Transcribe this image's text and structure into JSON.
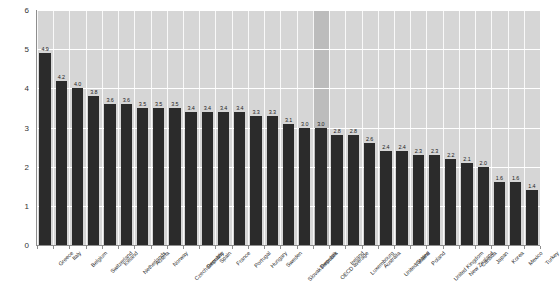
{
  "chart_data": {
    "type": "bar",
    "title": "",
    "subtitle": "",
    "xlabel": "",
    "ylabel": "",
    "ylim": [
      0,
      6
    ],
    "ytick_labels": [
      "0",
      "1",
      "2",
      "3",
      "4",
      "5",
      "6"
    ],
    "ytick_values": [
      0,
      1,
      2,
      3,
      4,
      5,
      6
    ],
    "grid": "horizontal-and-vertical",
    "legend": "none",
    "bar_color": "#2b2b2b",
    "plot_background": "#d6d6d6",
    "highlight_color": "#bcbcbc",
    "highlight_category": "OECD average",
    "categories": [
      "Greece",
      "Italy",
      "Belgium",
      "Switzerland",
      "Iceland",
      "Netherlands",
      "Austria",
      "Norway",
      "Czech Republic",
      "Germany",
      "Spain",
      "France",
      "Portugal",
      "Hungary",
      "Sweden",
      "Slovak Republic",
      "Denmark",
      "OECD average",
      "Ireland",
      "Luxembourg",
      "Australia",
      "United States",
      "Finland",
      "Poland",
      "United Kingdom",
      "New Zealand",
      "Canada",
      "Japan",
      "Korea",
      "Mexico",
      "Turkey"
    ],
    "values": [
      4.9,
      4.2,
      4.0,
      3.8,
      3.6,
      3.6,
      3.5,
      3.5,
      3.5,
      3.4,
      3.4,
      3.4,
      3.4,
      3.3,
      3.3,
      3.1,
      3.0,
      3.0,
      2.8,
      2.8,
      2.6,
      2.4,
      2.4,
      2.3,
      2.3,
      2.2,
      2.1,
      2.0,
      1.6,
      1.6,
      1.4
    ],
    "data_labels": [
      "4.9",
      "4.2",
      "4.0",
      "3.8",
      "3.6",
      "3.6",
      "3.5",
      "3.5",
      "3.5",
      "3.4",
      "3.4",
      "3.4",
      "3.4",
      "3.3",
      "3.3",
      "3.1",
      "3.0",
      "3.0",
      "2.8",
      "2.8",
      "2.6",
      "2.4",
      "2.4",
      "2.3",
      "2.3",
      "2.2",
      "2.1",
      "2.0",
      "1.6",
      "1.6",
      "1.4"
    ]
  }
}
